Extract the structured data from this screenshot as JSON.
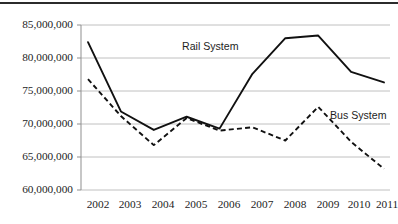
{
  "chart_data": {
    "type": "line",
    "title": "",
    "subtitle": "",
    "xlabel": "",
    "ylabel": "",
    "categories": [
      "2002",
      "2003",
      "2004",
      "2005",
      "2006",
      "2007",
      "2008",
      "2009",
      "2010",
      "2011"
    ],
    "ylim": [
      60000000,
      85000000
    ],
    "ytick_values": [
      60000000,
      65000000,
      70000000,
      75000000,
      80000000,
      85000000
    ],
    "ytick_labels": [
      "60,000,000",
      "65,000,000",
      "70,000,000",
      "75,000,000",
      "80,000,000",
      "85,000,000"
    ],
    "grid": "horizontal",
    "legend_position": "inline-annotations",
    "series": [
      {
        "name": "Rail System",
        "style": "solid",
        "color": "#111111",
        "values": [
          82400000,
          71900000,
          69100000,
          71100000,
          69300000,
          77600000,
          83000000,
          83400000,
          77900000,
          76300000
        ]
      },
      {
        "name": "Bus System",
        "style": "dashed",
        "color": "#111111",
        "values": [
          76800000,
          71200000,
          66800000,
          70900000,
          69000000,
          69500000,
          67500000,
          72600000,
          67300000,
          63200000
        ]
      }
    ],
    "annotations": [
      {
        "text": "Rail System",
        "series": "Rail System"
      },
      {
        "text": "Bus System",
        "series": "Bus System"
      }
    ]
  }
}
